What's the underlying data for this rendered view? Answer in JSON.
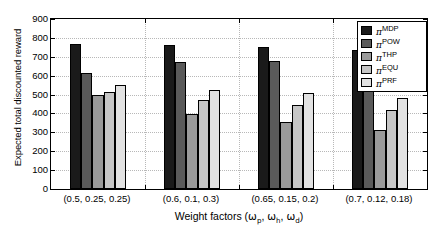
{
  "chart_data": {
    "type": "bar",
    "title": "",
    "xlabel": "Weight factors (ωp, ωh, ωd)",
    "ylabel": "Expected total discounted reward",
    "categories": [
      "(0.5, 0.25, 0.25)",
      "(0.6, 0.1, 0.3)",
      "(0.65, 0.15, 0.2)",
      "(0.7, 0.12, 0.18)"
    ],
    "series": [
      {
        "name": "πMDP",
        "label_base": "π",
        "label_sup": "MDP",
        "color": "#1a1a1a",
        "values": [
          770,
          760,
          750,
          735
        ]
      },
      {
        "name": "πPOW",
        "label_base": "π",
        "label_sup": "POW",
        "color": "#5a5a5a",
        "values": [
          615,
          670,
          680,
          715
        ]
      },
      {
        "name": "πTHP",
        "label_base": "π",
        "label_sup": "THP",
        "color": "#9a9a9a",
        "values": [
          500,
          395,
          355,
          310
        ]
      },
      {
        "name": "πEQU",
        "label_base": "π",
        "label_sup": "EQU",
        "color": "#c6c6c6",
        "values": [
          512,
          470,
          445,
          420
        ]
      },
      {
        "name": "πPRF",
        "label_base": "π",
        "label_sup": "PRF",
        "color": "#e2e2e2",
        "values": [
          550,
          525,
          510,
          480
        ]
      }
    ],
    "ylim": [
      0,
      900
    ],
    "yticks": [
      0,
      100,
      200,
      300,
      400,
      500,
      600,
      700,
      800,
      900
    ],
    "ytick_labels": [
      "0",
      "100",
      "200",
      "300",
      "400",
      "500",
      "600",
      "700",
      "800",
      "900"
    ],
    "grid": true,
    "legend_position": "upper right"
  },
  "axis": {
    "ylabel": "Expected total discounted reward",
    "xlabel_prefix": "Weight factors (",
    "xlabel_suffix": ")",
    "xlabel_omega": "ω",
    "xlabel_sub1": "p",
    "xlabel_sub2": "h",
    "xlabel_sub3": "d",
    "xlabel_sep": ", "
  }
}
